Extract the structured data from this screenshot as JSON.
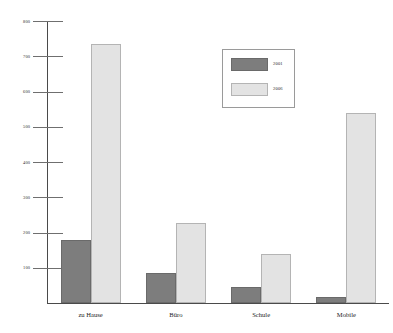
{
  "chart_data": {
    "type": "bar",
    "title": "",
    "subtitle": "",
    "xlabel": "",
    "ylabel": "",
    "categories": [
      "zu Hause",
      "Büro",
      "Schule",
      "Mobile"
    ],
    "series": [
      {
        "name": "2001",
        "color": "#7d7d7d",
        "values": [
          180,
          85,
          45,
          18
        ]
      },
      {
        "name": "2006",
        "color": "#e3e3e3",
        "values": [
          735,
          228,
          138,
          540
        ]
      }
    ],
    "ylim": [
      0,
      800
    ],
    "ytick_values": [
      100,
      200,
      300,
      400,
      500,
      600,
      700,
      800
    ],
    "ytick_labels": [
      "100",
      "200",
      "300",
      "400",
      "500",
      "600",
      "700",
      "800"
    ],
    "grid": false,
    "legend_position": "upper-right",
    "annotations": []
  },
  "legend": {
    "entries": [
      {
        "label": "2001",
        "color": "#7d7d7d"
      },
      {
        "label": "2006",
        "color": "#e3e3e3"
      }
    ]
  }
}
